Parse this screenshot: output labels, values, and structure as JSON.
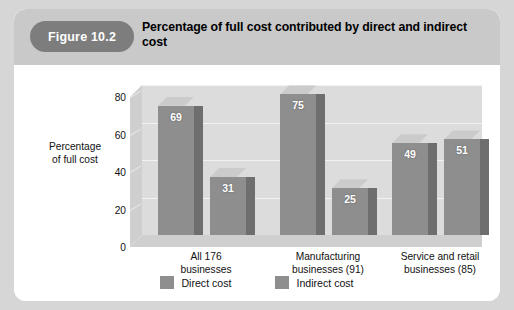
{
  "figure": {
    "badge_label": "Figure 10.2",
    "title": "Percentage of full cost contributed by direct and indirect cost"
  },
  "chart_data": {
    "type": "bar",
    "title": "Percentage of full cost contributed by direct and indirect cost",
    "xlabel": "",
    "ylabel": "Percentage of full cost",
    "ylabel_line1": "Percentage",
    "ylabel_line2": "of full cost",
    "ylim": [
      0,
      80
    ],
    "yticks": [
      0,
      20,
      40,
      60,
      80
    ],
    "ytick_labels": [
      "0",
      "20",
      "40",
      "60",
      "80"
    ],
    "grid": true,
    "legend_position": "bottom",
    "three_d": true,
    "categories": [
      "All 176 businesses",
      "Manufacturing businesses (91)",
      "Service and retail businesses (85)"
    ],
    "category_lines": [
      [
        "All 176",
        "businesses"
      ],
      [
        "Manufacturing",
        "businesses (91)"
      ],
      [
        "Service and retail",
        "businesses (85)"
      ]
    ],
    "series": [
      {
        "name": "Direct cost",
        "color": "#8e8e8e",
        "values": [
          69,
          75,
          49
        ],
        "value_labels": [
          "69",
          "75",
          "49"
        ]
      },
      {
        "name": "Indirect cost",
        "color": "#8e8e8e",
        "values": [
          31,
          25,
          51
        ],
        "value_labels": [
          "31",
          "25",
          "51"
        ]
      }
    ]
  },
  "colors": {
    "page_background": "#d6d6d6",
    "card_background": "#ffffff",
    "header_banner": "#c9c9c9",
    "badge": "#7d7d7d",
    "plot_wall": "#dcdcdc",
    "plot_floor": "#cfcfcf",
    "gridline": "#f2f2f2",
    "bar_front": "#8e8e8e",
    "bar_top": "#cbcbcb",
    "bar_side": "#6e6e6e"
  }
}
